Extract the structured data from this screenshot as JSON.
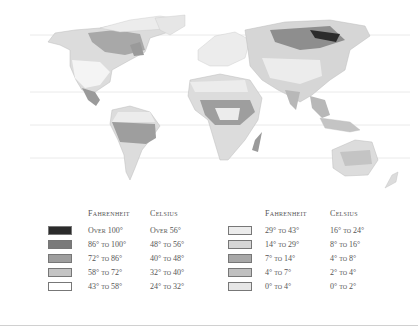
{
  "map": {
    "title": "World Temperature Map",
    "latitude_lines_y": [
      35,
      92,
      125,
      158
    ],
    "zone_colors": {
      "over_100": "#2b2b2b",
      "86_100": "#7a7a7a",
      "72_86": "#9e9e9e",
      "58_72": "#c4c4c4",
      "43_58": "#ffffff",
      "29_43": "#ececec",
      "14_29": "#d6d6d6",
      "7_14": "#a8a8a8",
      "4_7": "#c0c0c0",
      "0_4": "#e6e6e6"
    }
  },
  "legend": {
    "left": {
      "fahrenheit_header": "Fahrenheit",
      "celsius_header": "Celsius",
      "rows": [
        {
          "fahrenheit": "Over 100°",
          "celsius": "Over 56°",
          "color": "#2b2b2b"
        },
        {
          "fahrenheit": "86° to 100°",
          "celsius": "48° to 56°",
          "color": "#7a7a7a"
        },
        {
          "fahrenheit": "72° to 86°",
          "celsius": "40° to 48°",
          "color": "#9e9e9e"
        },
        {
          "fahrenheit": "58° to 72°",
          "celsius": "32° to 40°",
          "color": "#c4c4c4"
        },
        {
          "fahrenheit": "43° to 58°",
          "celsius": "24° to 32°",
          "color": "#ffffff"
        }
      ]
    },
    "right": {
      "fahrenheit_header": "Fahrenheit",
      "celsius_header": "Celsius",
      "rows": [
        {
          "fahrenheit": "29° to 43°",
          "celsius": "16° to 24°",
          "color": "#ececec"
        },
        {
          "fahrenheit": "14° to 29°",
          "celsius": "8° to 16°",
          "color": "#d6d6d6"
        },
        {
          "fahrenheit": "7° to 14°",
          "celsius": "4° to 8°",
          "color": "#a8a8a8"
        },
        {
          "fahrenheit": "4° to 7°",
          "celsius": "2° to 4°",
          "color": "#c0c0c0"
        },
        {
          "fahrenheit": "0° to 4°",
          "celsius": "0° to 2°",
          "color": "#e6e6e6"
        }
      ]
    }
  }
}
